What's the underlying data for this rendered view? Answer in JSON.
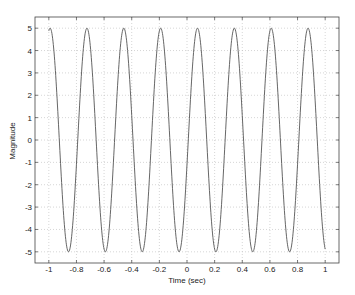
{
  "chart_data": {
    "type": "line",
    "title": "",
    "xlabel": "Time (sec)",
    "ylabel": "Magnitude",
    "xlim": [
      -1.1,
      1.1
    ],
    "ylim": [
      -5.5,
      5.5
    ],
    "grid": true,
    "legend": null,
    "xticks": [
      -1,
      -0.8,
      -0.6,
      -0.4,
      -0.2,
      0,
      0.2,
      0.4,
      0.6,
      0.8,
      1
    ],
    "xtick_labels": [
      "-1",
      "-0.8",
      "-0.6",
      "-0.4",
      "-0.2",
      "0",
      "0.2",
      "0.4",
      "0.6",
      "0.8",
      "1"
    ],
    "yticks": [
      5,
      4,
      3,
      2,
      1,
      0,
      -1,
      -2,
      -3,
      -4,
      -5
    ],
    "ytick_labels": [
      "5",
      "4",
      "3",
      "2",
      "1",
      "0",
      "-1",
      "-2",
      "-3",
      "-4",
      "-5"
    ],
    "series": [
      {
        "name": "signal",
        "description": "sinusoid, amplitude 5, frequency ~3.75 Hz, t from -1 to 1",
        "amplitude": 5,
        "frequency_hz": 3.75,
        "peak_offset_sec": 0.076,
        "t_range": [
          -1,
          1
        ],
        "peaks_t": [
          -0.978,
          -0.716,
          -0.455,
          -0.193,
          0.076,
          0.345,
          0.615,
          0.884
        ],
        "troughs_t": [
          -0.855,
          -0.585,
          -0.324,
          -0.062,
          0.207,
          0.476,
          0.738
        ],
        "start_value": 4.9,
        "end_value": -4.9,
        "color": "#555555"
      }
    ]
  },
  "colors": {
    "frame": "#444444",
    "grid": "#bbbbbb",
    "line": "#555555",
    "text": "#222222"
  }
}
